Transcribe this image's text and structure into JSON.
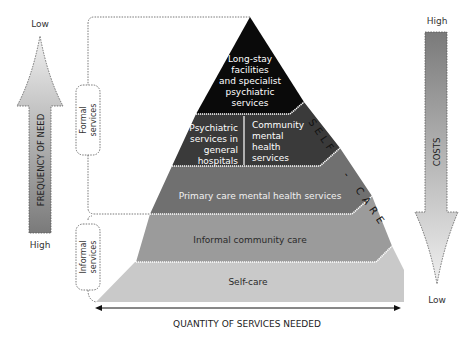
{
  "diagram": {
    "tiers": [
      {
        "id": "long-stay",
        "lines": [
          "Long-stay",
          "facilities",
          "and specialist",
          "psychiatric",
          "services"
        ],
        "fill": "#0a0a0a",
        "text_color": "#ffffff"
      },
      {
        "id": "psychiatric-general",
        "lines": [
          "Psychiatric",
          "services in",
          "general",
          "hospitals"
        ],
        "fill": "#3a3a3a",
        "text_color": "#ffffff"
      },
      {
        "id": "community-mental-health",
        "lines": [
          "Community",
          "mental",
          "health",
          "services"
        ],
        "fill": "#3a3a3a",
        "text_color": "#ffffff"
      },
      {
        "id": "primary-care",
        "lines": [
          "Primary care mental health services"
        ],
        "fill": "#6e6e6e",
        "text_color": "#ffffff"
      },
      {
        "id": "informal-community",
        "lines": [
          "Informal community care"
        ],
        "fill": "#9a9a9a",
        "text_color": "#2a2a2a"
      },
      {
        "id": "self-care",
        "lines": [
          "Self-care"
        ],
        "fill": "#c8c8c8",
        "text_color": "#2a2a2a"
      }
    ],
    "self_care_side_label": "SELF-CARE",
    "brackets": {
      "formal": {
        "lines": [
          "Formal",
          "services"
        ]
      },
      "informal": {
        "lines": [
          "Informal",
          "services"
        ]
      }
    },
    "left_arrow": {
      "label": "FREQUENCY OF NEED",
      "top_label": "Low",
      "bottom_label": "High"
    },
    "right_arrow": {
      "label": "COSTS",
      "top_label": "High",
      "bottom_label": "Low"
    },
    "bottom_axis": {
      "label": "QUANTITY OF SERVICES NEEDED"
    }
  }
}
